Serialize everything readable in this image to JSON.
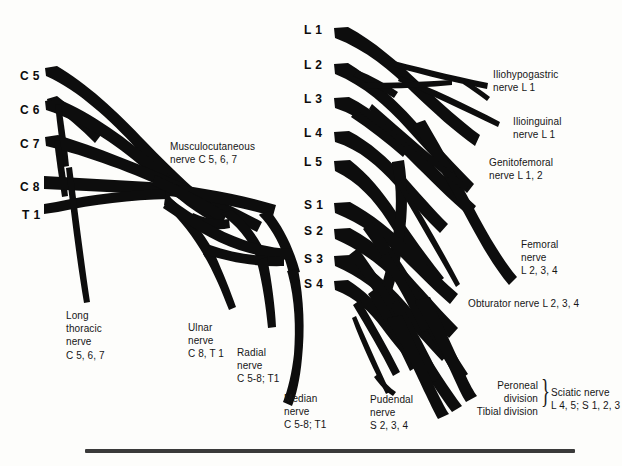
{
  "figure": {
    "background_color": "#fdfdfb",
    "ink_color": "#0d0d0d",
    "rule_color": "#3a3a3a"
  },
  "brachial_plexus": {
    "roots": [
      {
        "label": "C 5",
        "x": 20,
        "y": 69
      },
      {
        "label": "C 6",
        "x": 20,
        "y": 103
      },
      {
        "label": "C 7",
        "x": 20,
        "y": 137
      },
      {
        "label": "C 8",
        "x": 20,
        "y": 180
      },
      {
        "label": "T 1",
        "x": 22,
        "y": 208
      }
    ],
    "nerves": [
      {
        "name": "musculocutaneous",
        "lines": [
          "Musculocutaneous",
          "nerve C 5, 6, 7"
        ],
        "x": 170,
        "y": 140,
        "align": "left"
      },
      {
        "name": "long-thoracic",
        "lines": [
          "Long",
          "thoracic",
          "nerve",
          "C 5, 6, 7"
        ],
        "x": 66,
        "y": 309,
        "align": "left"
      },
      {
        "name": "ulnar",
        "lines": [
          "Ulnar",
          "nerve",
          "C 8, T 1"
        ],
        "x": 188,
        "y": 321,
        "align": "left"
      },
      {
        "name": "radial",
        "lines": [
          "Radial",
          "nerve",
          "C 5-8; T1"
        ],
        "x": 237,
        "y": 346,
        "align": "left"
      },
      {
        "name": "median",
        "lines": [
          "Median",
          "nerve",
          "C 5-8; T1"
        ],
        "x": 284,
        "y": 392,
        "align": "left"
      }
    ]
  },
  "lumbosacral_plexus": {
    "roots": [
      {
        "label": "L 1",
        "x": 304,
        "y": 23
      },
      {
        "label": "L 2",
        "x": 304,
        "y": 58
      },
      {
        "label": "L 3",
        "x": 304,
        "y": 92
      },
      {
        "label": "L 4",
        "x": 304,
        "y": 126
      },
      {
        "label": "L 5",
        "x": 304,
        "y": 155
      },
      {
        "label": "S 1",
        "x": 304,
        "y": 198
      },
      {
        "label": "S 2",
        "x": 304,
        "y": 224
      },
      {
        "label": "S 3",
        "x": 304,
        "y": 252
      },
      {
        "label": "S 4",
        "x": 304,
        "y": 277
      }
    ],
    "nerves": [
      {
        "name": "iliohypogastric",
        "lines": [
          "Iliohypogastric",
          "nerve L 1"
        ],
        "x": 493,
        "y": 68,
        "align": "left"
      },
      {
        "name": "ilioinguinal",
        "lines": [
          "Ilioinguinal",
          "nerve L 1"
        ],
        "x": 513,
        "y": 115,
        "align": "left"
      },
      {
        "name": "genitofemoral",
        "lines": [
          "Genitofemoral",
          "nerve L 1, 2"
        ],
        "x": 489,
        "y": 156,
        "align": "left"
      },
      {
        "name": "femoral",
        "lines": [
          "Femoral",
          "nerve",
          "L 2, 3, 4"
        ],
        "x": 521,
        "y": 238,
        "align": "left"
      },
      {
        "name": "obturator",
        "lines": [
          "Obturator nerve L 2, 3, 4"
        ],
        "x": 468,
        "y": 297,
        "align": "left"
      },
      {
        "name": "pudendal",
        "lines": [
          "Pudendal",
          "nerve",
          "S 2, 3, 4"
        ],
        "x": 370,
        "y": 393,
        "align": "left"
      }
    ],
    "sciatic": {
      "peroneal_division": "Peroneal\ndivision",
      "tibial_division": "Tibial division",
      "brace": "}",
      "label": "Sciatic nerve\nL 4, 5; S 1, 2, 3",
      "peroneal_x": 480,
      "peroneal_y": 379,
      "tibial_x": 444,
      "tibial_y": 405,
      "brace_x": 541,
      "brace_y": 374,
      "label_x": 551,
      "label_y": 386
    }
  },
  "footer_rule": {
    "x": 85,
    "y": 449,
    "width": 490
  }
}
